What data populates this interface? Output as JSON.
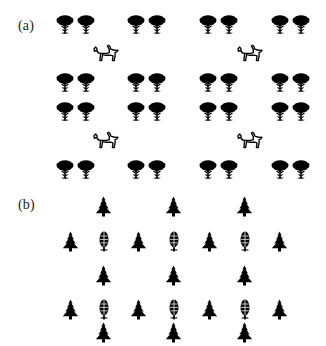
{
  "figure": {
    "background_color": "#ffffff",
    "ink_color": "#000000",
    "label_color": "#222222",
    "width": 326,
    "height": 346
  },
  "panels": [
    {
      "id": "panel-a",
      "label": "(a)",
      "label_x": 18,
      "label_y": 19,
      "description": "grouped broadleaf trees in pairs with outline dogs",
      "icon_types": [
        "broadleaf-tree-icon",
        "dog-icon"
      ],
      "glyphs": [
        {
          "kind": "broadleaf-tree",
          "x": 56,
          "y": 14
        },
        {
          "kind": "broadleaf-tree",
          "x": 77,
          "y": 14
        },
        {
          "kind": "broadleaf-tree",
          "x": 127,
          "y": 14
        },
        {
          "kind": "broadleaf-tree",
          "x": 148,
          "y": 14
        },
        {
          "kind": "broadleaf-tree",
          "x": 199,
          "y": 14
        },
        {
          "kind": "broadleaf-tree",
          "x": 220,
          "y": 14
        },
        {
          "kind": "broadleaf-tree",
          "x": 271,
          "y": 14
        },
        {
          "kind": "broadleaf-tree",
          "x": 292,
          "y": 14
        },
        {
          "kind": "dog",
          "x": 93,
          "y": 44
        },
        {
          "kind": "dog",
          "x": 237,
          "y": 44
        },
        {
          "kind": "broadleaf-tree",
          "x": 56,
          "y": 72
        },
        {
          "kind": "broadleaf-tree",
          "x": 77,
          "y": 72
        },
        {
          "kind": "broadleaf-tree",
          "x": 127,
          "y": 72
        },
        {
          "kind": "broadleaf-tree",
          "x": 148,
          "y": 72
        },
        {
          "kind": "broadleaf-tree",
          "x": 199,
          "y": 72
        },
        {
          "kind": "broadleaf-tree",
          "x": 220,
          "y": 72
        },
        {
          "kind": "broadleaf-tree",
          "x": 271,
          "y": 72
        },
        {
          "kind": "broadleaf-tree",
          "x": 292,
          "y": 72
        },
        {
          "kind": "broadleaf-tree",
          "x": 56,
          "y": 101
        },
        {
          "kind": "broadleaf-tree",
          "x": 77,
          "y": 101
        },
        {
          "kind": "broadleaf-tree",
          "x": 127,
          "y": 101
        },
        {
          "kind": "broadleaf-tree",
          "x": 148,
          "y": 101
        },
        {
          "kind": "broadleaf-tree",
          "x": 199,
          "y": 101
        },
        {
          "kind": "broadleaf-tree",
          "x": 220,
          "y": 101
        },
        {
          "kind": "broadleaf-tree",
          "x": 271,
          "y": 101
        },
        {
          "kind": "broadleaf-tree",
          "x": 292,
          "y": 101
        },
        {
          "kind": "dog",
          "x": 93,
          "y": 131
        },
        {
          "kind": "dog",
          "x": 237,
          "y": 131
        },
        {
          "kind": "broadleaf-tree",
          "x": 56,
          "y": 159
        },
        {
          "kind": "broadleaf-tree",
          "x": 77,
          "y": 159
        },
        {
          "kind": "broadleaf-tree",
          "x": 127,
          "y": 159
        },
        {
          "kind": "broadleaf-tree",
          "x": 148,
          "y": 159
        },
        {
          "kind": "broadleaf-tree",
          "x": 199,
          "y": 159
        },
        {
          "kind": "broadleaf-tree",
          "x": 220,
          "y": 159
        },
        {
          "kind": "broadleaf-tree",
          "x": 271,
          "y": 159
        },
        {
          "kind": "broadleaf-tree",
          "x": 292,
          "y": 159
        }
      ]
    },
    {
      "id": "panel-b",
      "label": "(b)",
      "label_x": 18,
      "label_y": 198,
      "description": "diamond clusters of fir trees surrounding narrow oval trees",
      "icon_types": [
        "fir-tree-icon",
        "oval-tree-icon"
      ],
      "glyphs": [
        {
          "kind": "fir-tree",
          "x": 95,
          "y": 196
        },
        {
          "kind": "fir-tree",
          "x": 165,
          "y": 196
        },
        {
          "kind": "fir-tree",
          "x": 236,
          "y": 196
        },
        {
          "kind": "fir-tree",
          "x": 62,
          "y": 231
        },
        {
          "kind": "oval-tree",
          "x": 98,
          "y": 230
        },
        {
          "kind": "fir-tree",
          "x": 130,
          "y": 231
        },
        {
          "kind": "oval-tree",
          "x": 168,
          "y": 230
        },
        {
          "kind": "fir-tree",
          "x": 201,
          "y": 231
        },
        {
          "kind": "oval-tree",
          "x": 239,
          "y": 230
        },
        {
          "kind": "fir-tree",
          "x": 271,
          "y": 231
        },
        {
          "kind": "fir-tree",
          "x": 95,
          "y": 265
        },
        {
          "kind": "fir-tree",
          "x": 165,
          "y": 265
        },
        {
          "kind": "fir-tree",
          "x": 236,
          "y": 265
        },
        {
          "kind": "fir-tree",
          "x": 62,
          "y": 299
        },
        {
          "kind": "oval-tree",
          "x": 98,
          "y": 298
        },
        {
          "kind": "fir-tree",
          "x": 130,
          "y": 299
        },
        {
          "kind": "oval-tree",
          "x": 168,
          "y": 298
        },
        {
          "kind": "fir-tree",
          "x": 201,
          "y": 299
        },
        {
          "kind": "oval-tree",
          "x": 239,
          "y": 298
        },
        {
          "kind": "fir-tree",
          "x": 271,
          "y": 299
        },
        {
          "kind": "fir-tree",
          "x": 95,
          "y": 322
        },
        {
          "kind": "fir-tree",
          "x": 165,
          "y": 322
        },
        {
          "kind": "fir-tree",
          "x": 236,
          "y": 322
        }
      ]
    }
  ]
}
